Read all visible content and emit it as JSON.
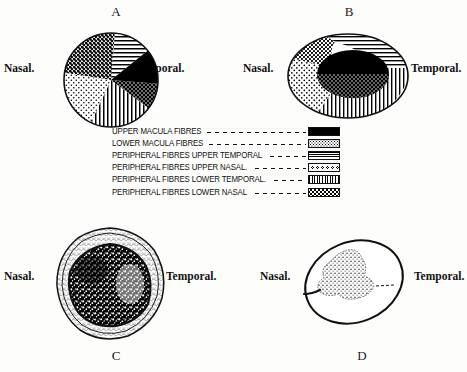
{
  "figures": {
    "a": {
      "letter": "A",
      "nasal": "Nasal.",
      "temporal": "Temporal."
    },
    "b": {
      "letter": "B",
      "nasal": "Nasal.",
      "temporal": "Temporal."
    },
    "c": {
      "letter": "C",
      "nasal": "Nasal.",
      "temporal": "Temporal."
    },
    "d": {
      "letter": "D",
      "nasal": "Nasal.",
      "temporal": "Temporal."
    }
  },
  "legend": {
    "rows": [
      {
        "label": "UPPER MACULA FIBRES",
        "pattern": "solid-black"
      },
      {
        "label": "LOWER MACULA FIBRES",
        "pattern": "coarse-stipple"
      },
      {
        "label": "PERIPHERAL FIBRES UPPER TEMPORAL",
        "pattern": "horizontal-lines"
      },
      {
        "label": "PERIPHERAL FIBRES UPPER NASAL.",
        "pattern": "small-circles"
      },
      {
        "label": "PERIPHERAL FIBRES LOWER TEMPORAL.",
        "pattern": "vertical-lines"
      },
      {
        "label": "PERIPHERAL FIBRES LOWER NASAL",
        "pattern": "crosses"
      }
    ]
  },
  "colors": {
    "ink": "#111111",
    "paper": "#fdfdfc"
  }
}
